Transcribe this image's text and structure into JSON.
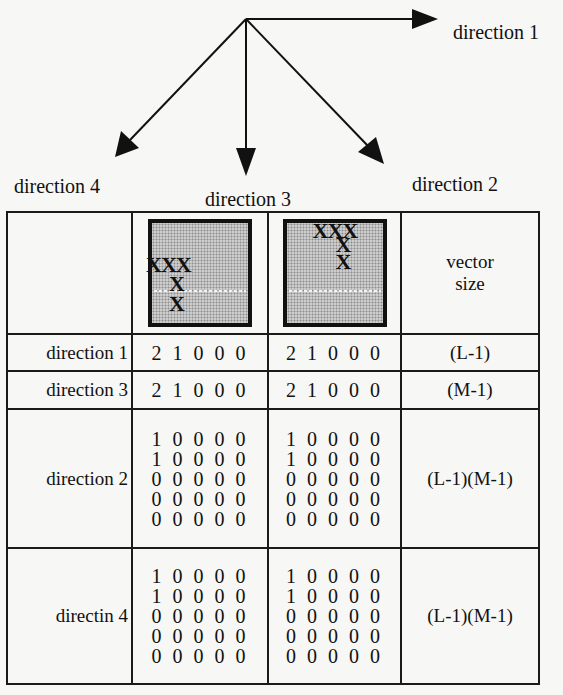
{
  "diagram": {
    "arrows": [
      {
        "name": "direction 1",
        "from": [
          246,
          19
        ],
        "to": [
          438,
          19
        ]
      },
      {
        "name": "direction 2",
        "from": [
          246,
          19
        ],
        "to": [
          384,
          163
        ]
      },
      {
        "name": "direction 3",
        "from": [
          246,
          19
        ],
        "to": [
          245,
          176
        ]
      },
      {
        "name": "direction 4",
        "from": [
          246,
          19
        ],
        "to": [
          116,
          156
        ]
      }
    ],
    "labels": {
      "direction1": "direction 1",
      "direction2": "direction 2",
      "direction3": "direction 3",
      "direction4": "direction 4"
    }
  },
  "table": {
    "header": {
      "corner": "",
      "image1": {
        "marks": [
          "XXX",
          "X",
          "X"
        ],
        "description": "shaded square, X pattern in lower-left"
      },
      "image2": {
        "marks": [
          "XXX",
          "X",
          "X"
        ],
        "description": "shaded square, X pattern at top"
      },
      "size_header_line1": "vector",
      "size_header_line2": "size"
    },
    "rows": [
      {
        "label": "direction 1",
        "col1": [
          "2 1 0 0 0"
        ],
        "col2": [
          "2 1 0 0 0"
        ],
        "size": "(L-1)"
      },
      {
        "label": "direction 3",
        "col1": [
          "2 1 0 0 0"
        ],
        "col2": [
          "2 1 0 0 0"
        ],
        "size": "(M-1)"
      },
      {
        "label": "direction 2",
        "col1": [
          "1 0 0 0 0",
          "1 0 0 0 0",
          "0 0 0 0 0",
          "0 0 0 0 0",
          "0 0 0 0 0"
        ],
        "col2": [
          "1 0 0 0 0",
          "1 0 0 0 0",
          "0 0 0 0 0",
          "0 0 0 0 0",
          "0 0 0 0 0"
        ],
        "size": "(L-1)(M-1)"
      },
      {
        "label": "directin 4",
        "col1": [
          "1 0 0 0 0",
          "1 0 0 0 0",
          "0 0 0 0 0",
          "0 0 0 0 0",
          "0 0 0 0 0"
        ],
        "col2": [
          "1 0 0 0 0",
          "1 0 0 0 0",
          "0 0 0 0 0",
          "0 0 0 0 0",
          "0 0 0 0 0"
        ],
        "size": "(L-1)(M-1)"
      }
    ]
  }
}
